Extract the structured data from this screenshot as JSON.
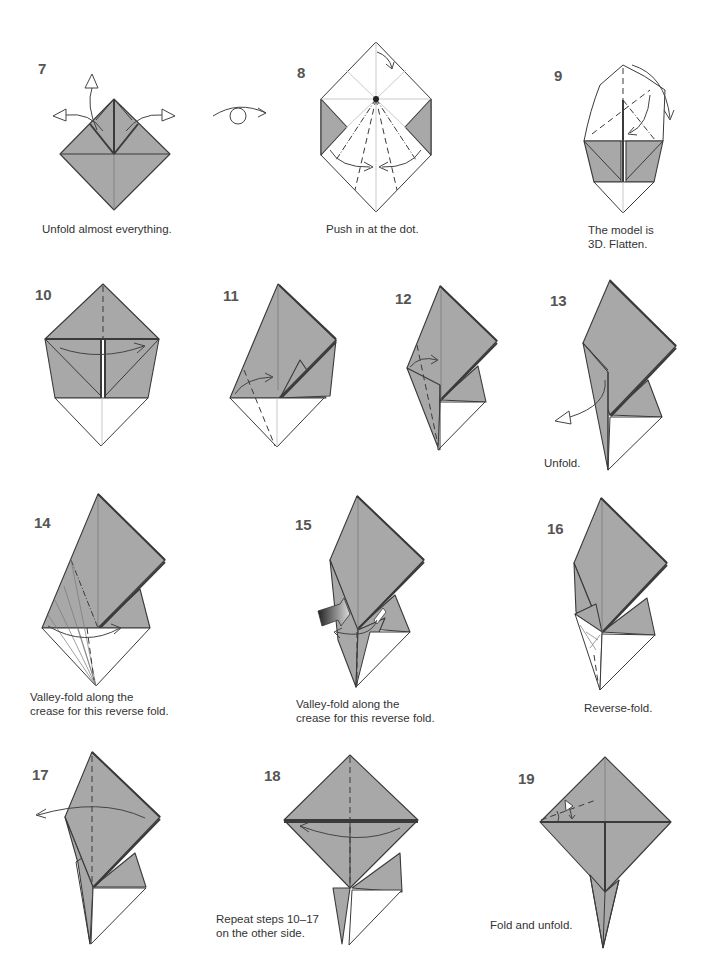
{
  "page": {
    "colors": {
      "paper_colored": "#a8a8a8",
      "paper_white": "#ffffff",
      "line": "#3a3a3a",
      "text": "#333333"
    }
  },
  "steps": [
    {
      "number": "7",
      "caption": "Unfold almost everything."
    },
    {
      "number": "8",
      "caption": "Push in at the dot."
    },
    {
      "number": "9",
      "caption_line1": "The model is",
      "caption_line2": "3D. Flatten."
    },
    {
      "number": "10",
      "caption": ""
    },
    {
      "number": "11",
      "caption": ""
    },
    {
      "number": "12",
      "caption": ""
    },
    {
      "number": "13",
      "caption": "Unfold."
    },
    {
      "number": "14",
      "caption_line1": "Valley-fold along the",
      "caption_line2": "crease for this reverse fold."
    },
    {
      "number": "15",
      "caption_line1": "Valley-fold along the",
      "caption_line2": "crease for this reverse fold."
    },
    {
      "number": "16",
      "caption": "Reverse-fold."
    },
    {
      "number": "17",
      "caption": ""
    },
    {
      "number": "18",
      "caption_line1": "Repeat steps 10–17",
      "caption_line2": "on the other side."
    },
    {
      "number": "19",
      "caption": "Fold and unfold."
    }
  ],
  "symbols": {
    "turn_over": "turn-over-symbol",
    "push_arrow": "push-arrow",
    "unfold_arrow": "hollow-arrow",
    "fold_arrow": "curved-arrow"
  }
}
